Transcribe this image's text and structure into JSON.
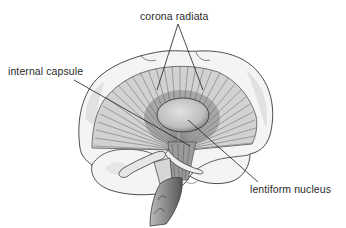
{
  "diagram": {
    "labels": {
      "corona_radiata": "corona radiata",
      "internal_capsule": "internal capsule",
      "lentiform_nucleus": "lentiform nucleus"
    },
    "colors": {
      "background": "#ffffff",
      "outline": "#3a3a3a",
      "fiber_fill": "#cfcfcf",
      "fiber_stroke": "#555555",
      "cortex_fill": "#ececec",
      "nucleus_fill": "#c8c8c8",
      "leader_line": "#1e1e1e",
      "label_text": "#2a2a2a"
    }
  }
}
